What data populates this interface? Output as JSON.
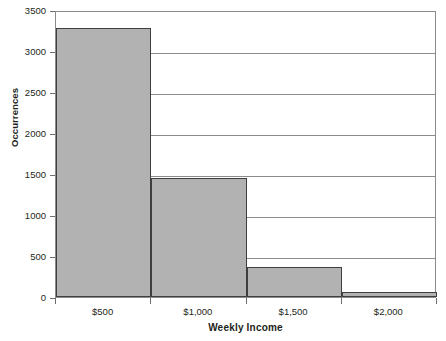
{
  "chart_data": {
    "type": "bar",
    "title": "",
    "xlabel": "Weekly Income",
    "ylabel": "Occurrences",
    "categories": [
      "$500",
      "$1,000",
      "$1,500",
      "$2,000"
    ],
    "values": [
      3280,
      1450,
      370,
      60
    ],
    "ylim": [
      0,
      3500
    ],
    "ytick_labels": [
      "0",
      "500",
      "1000",
      "1500",
      "2000",
      "2500",
      "3000",
      "3500"
    ],
    "ytick_values": [
      0,
      500,
      1000,
      1500,
      2000,
      2500,
      3000,
      3500
    ],
    "grid": true,
    "legend": "none",
    "bar_fill_color": "#b2b2b2",
    "bar_border_color": "#3f3f3f",
    "axis_color": "#8b8b8b",
    "text_color": "#231f20"
  }
}
